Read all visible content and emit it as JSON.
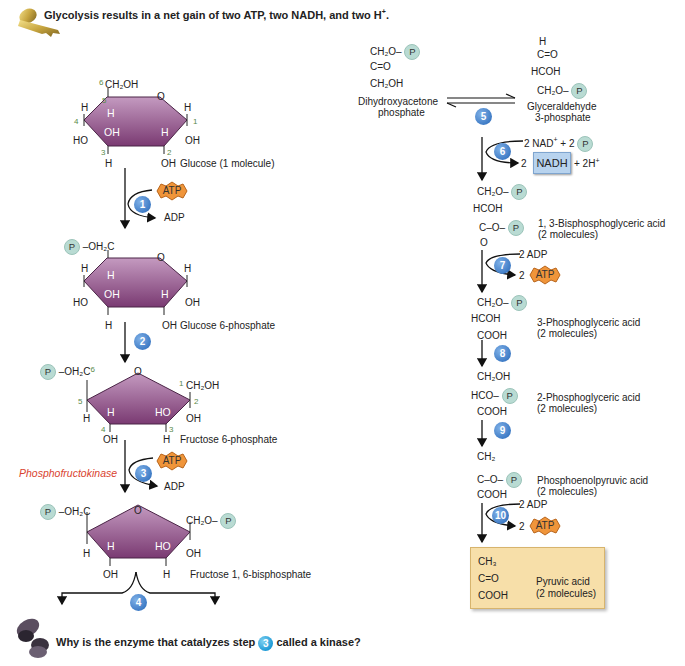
{
  "header": {
    "key_icon": "key-icon",
    "title": "Glycolysis results in a net gain of two ATP, two NADH, and two H",
    "title_sup": "+",
    "title_end": "."
  },
  "footer": {
    "question_icon": "question-mark-icon",
    "question_pre": "Why is the enzyme that catalyzes step",
    "question_step": "3",
    "question_post": "called a kinase?"
  },
  "left_pathway": {
    "glucose": {
      "c6_label": "6",
      "ch2oh": "CH₂OH",
      "c5": "5",
      "c4": "4",
      "c3": "3",
      "c2": "2",
      "c1": "1",
      "ring_o": "O",
      "h_left": "H",
      "h_right": "H",
      "ho_left": "HO",
      "oh_right": "OH",
      "ring_h_upper": "H",
      "ring_oh": "OH",
      "ring_h_right": "H",
      "h_bottom": "H",
      "oh_bottom": "OH",
      "name": "Glucose (1 molecule)"
    },
    "step1": {
      "number": "1",
      "input": "ATP",
      "output": "ADP"
    },
    "glucose6p": {
      "p_label": "P",
      "group": "–OH₂C",
      "ring_o": "O",
      "h_left": "H",
      "h_right": "H",
      "ho_left": "HO",
      "oh_right": "OH",
      "ring_h_upper": "H",
      "ring_oh": "OH",
      "ring_h_right": "H",
      "h_bottom": "H",
      "oh_bottom": "OH",
      "name": "Glucose 6-phosphate"
    },
    "step2": {
      "number": "2"
    },
    "fructose6p": {
      "p_label": "P",
      "group": "–OH₂C",
      "c6": "6",
      "c5": "5",
      "c4": "4",
      "c3": "3",
      "c2": "2",
      "c1": "1",
      "ring_o": "O",
      "ch2oh": "CH₂OH",
      "h_left": "H",
      "oh_right": "OH",
      "ring_h": "H",
      "ring_ho": "HO",
      "oh_bottom": "OH",
      "h_bottom": "H",
      "name": "Fructose 6-phosphate"
    },
    "step3": {
      "number": "3",
      "enzyme": "Phosphofructokinase",
      "input": "ATP",
      "output": "ADP"
    },
    "fructose16bp": {
      "p_left": "P",
      "group_left": "–OH₂C",
      "ring_o": "O",
      "group_right": "CH₂O–",
      "p_right": "P",
      "h_left": "H",
      "oh_right": "OH",
      "ring_h": "H",
      "ring_ho": "HO",
      "oh_bottom": "OH",
      "h_bottom": "H",
      "name": "Fructose 1, 6-bisphosphate"
    },
    "step4": {
      "number": "4"
    }
  },
  "right_pathway": {
    "dhap": {
      "line1": "CH₂O–",
      "p": "P",
      "line2": "C=O",
      "line3": "CH₂OH",
      "name_line1": "Dihydroxyacetone",
      "name_line2": "phosphate"
    },
    "step5": {
      "number": "5"
    },
    "g3p": {
      "line0": "H",
      "line1": "C=O",
      "line2": "HCOH",
      "line3": "CH₂O–",
      "p": "P",
      "name_line1": "Glyceraldehyde",
      "name_line2": "3-phosphate"
    },
    "step6": {
      "number": "6",
      "input": "2 NAD",
      "input_sup": "+",
      "input_plus": " + 2",
      "p": "P",
      "output_coef": "2",
      "output_nadh": "NADH",
      "output_extra": "+ 2H",
      "output_sup": "+"
    },
    "bpg": {
      "line1": "CH₂O–",
      "p1": "P",
      "line2": "HCOH",
      "line3": "C–O–",
      "p2": "P",
      "line4": "O",
      "name_line1": "1, 3-Bisphosphoglyceric acid",
      "name_line2": "(2 molecules)"
    },
    "step7": {
      "number": "7",
      "input": "2 ADP",
      "output_coef": "2",
      "output": "ATP"
    },
    "pg3": {
      "line1": "CH₂O–",
      "p": "P",
      "line2": "HCOH",
      "line3": "COOH",
      "name_line1": "3-Phosphoglyceric acid",
      "name_line2": "(2 molecules)"
    },
    "step8": {
      "number": "8"
    },
    "pg2": {
      "line1": "CH₂OH",
      "line2": "HCO–",
      "p": "P",
      "line3": "COOH",
      "name_line1": "2-Phosphoglyceric acid",
      "name_line2": "(2 molecules)"
    },
    "step9": {
      "number": "9"
    },
    "pep": {
      "line1": "CH₂",
      "line2": "C–O–",
      "p": "P",
      "line3": "COOH",
      "name_line1": "Phosphoenolpyruvic acid",
      "name_line2": "(2 molecules)"
    },
    "step10": {
      "number": "10",
      "input": "2 ADP",
      "output_coef": "2",
      "output": "ATP"
    },
    "pyruvate": {
      "line1": "CH₃",
      "line2": "C=O",
      "line3": "COOH",
      "name_line1": "Pyruvic acid",
      "name_line2": "(2 molecules)"
    }
  },
  "colors": {
    "ring_fill_top": "#c49ac0",
    "ring_fill_bottom": "#7a3a72",
    "step_badge": "#3f7cc6",
    "atp_fill": "#f0953a",
    "phosphate_circle": "#b9dbd3",
    "nadh_box": "#b8d3ee",
    "pyruvate_box": "#f7dfa9",
    "enzyme_label": "#d9432f",
    "carbon_numbers": "#5a8a4a"
  }
}
